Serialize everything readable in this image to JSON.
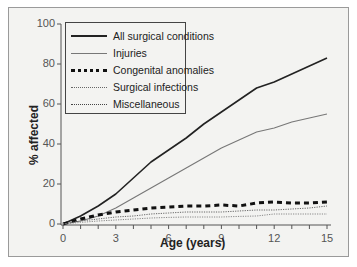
{
  "chart_data": {
    "type": "line",
    "title": "",
    "xlabel": "Age (years)",
    "ylabel": "% affected",
    "xlim": [
      0,
      15
    ],
    "ylim": [
      0,
      100
    ],
    "x_ticks": [
      0,
      3,
      6,
      9,
      12,
      15
    ],
    "y_ticks": [
      0,
      20,
      40,
      60,
      80,
      100
    ],
    "grid": false,
    "legend_position": "upper left",
    "x": [
      0,
      1,
      2,
      3,
      4,
      5,
      6,
      7,
      8,
      9,
      10,
      11,
      12,
      13,
      14,
      15
    ],
    "series": [
      {
        "name": "All surgical conditions",
        "style": "solid-thick",
        "color": "#222222",
        "values": [
          0,
          4,
          9,
          15,
          23,
          31,
          37,
          43,
          50,
          56,
          62,
          68,
          71,
          75,
          79,
          83
        ]
      },
      {
        "name": "Injuries",
        "style": "solid-thin",
        "color": "#777777",
        "values": [
          0,
          1.5,
          4,
          8,
          13,
          18,
          23,
          28,
          33,
          38,
          42,
          46,
          48,
          51,
          53,
          55
        ]
      },
      {
        "name": "Congenital anomalies",
        "style": "dashed-thick",
        "color": "#111111",
        "values": [
          0,
          2.5,
          4.5,
          6,
          7,
          8,
          8.5,
          9,
          9,
          9.5,
          9,
          10.5,
          11,
          10.5,
          10.5,
          11
        ]
      },
      {
        "name": "Surgical infections",
        "style": "dotted",
        "color": "#666666",
        "values": [
          0,
          1.5,
          2.5,
          3.5,
          4,
          5,
          5.5,
          6,
          6,
          6,
          6.5,
          7,
          7,
          7.5,
          8,
          9
        ]
      },
      {
        "name": "Miscellaneous",
        "style": "dotted",
        "color": "#888888",
        "values": [
          0,
          0.8,
          1.5,
          2,
          2.5,
          3,
          3.3,
          3.5,
          3.5,
          3.5,
          3.8,
          4,
          5,
          5,
          5,
          5
        ]
      }
    ]
  },
  "axes": {
    "xlabel": "Age (years)",
    "ylabel": "% affected",
    "x_ticks": [
      "0",
      "3",
      "6",
      "9",
      "12",
      "15"
    ],
    "y_ticks": [
      "0",
      "20",
      "40",
      "60",
      "80",
      "100"
    ]
  },
  "legend": {
    "items": [
      {
        "label": "All surgical conditions"
      },
      {
        "label": "Injuries"
      },
      {
        "label": "Congenital anomalies"
      },
      {
        "label": "Surgical infections"
      },
      {
        "label": "Miscellaneous"
      }
    ]
  }
}
